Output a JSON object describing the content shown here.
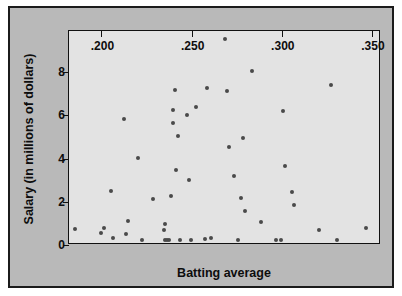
{
  "chart_data": {
    "type": "scatter",
    "title": "",
    "xlabel": "Batting average",
    "ylabel": "Salary (in millions of dollars)",
    "xlim": [
      0.182,
      0.355
    ],
    "ylim": [
      0,
      9.9
    ],
    "xticks": [
      0.2,
      0.25,
      0.3,
      0.35
    ],
    "xticklabels": [
      ".200",
      ".250",
      ".300",
      ".350"
    ],
    "yticks": [
      0,
      2,
      4,
      6,
      8
    ],
    "yticklabels": [
      "0",
      "2",
      "4",
      "6",
      "8"
    ],
    "grid": false,
    "legend": null,
    "marker_color": "#4a4a4a",
    "plot_bg_color": "#e3e3e3",
    "figure_bg_color": "#b9b9b9",
    "frame_color": "#111111",
    "n_points": 57,
    "points": [
      {
        "x": 0.1855,
        "y": 0.72
      },
      {
        "x": 0.1995,
        "y": 0.57
      },
      {
        "x": 0.2015,
        "y": 0.8
      },
      {
        "x": 0.2055,
        "y": 2.5
      },
      {
        "x": 0.2065,
        "y": 0.33
      },
      {
        "x": 0.2125,
        "y": 5.85
      },
      {
        "x": 0.2135,
        "y": 0.52
      },
      {
        "x": 0.2145,
        "y": 1.1
      },
      {
        "x": 0.2205,
        "y": 4.02
      },
      {
        "x": 0.2225,
        "y": 0.22
      },
      {
        "x": 0.2285,
        "y": 2.12
      },
      {
        "x": 0.2345,
        "y": 0.7
      },
      {
        "x": 0.2355,
        "y": 0.97
      },
      {
        "x": 0.2355,
        "y": 0.23
      },
      {
        "x": 0.2365,
        "y": 0.21
      },
      {
        "x": 0.2375,
        "y": 0.22
      },
      {
        "x": 0.2385,
        "y": 2.28
      },
      {
        "x": 0.2395,
        "y": 5.65
      },
      {
        "x": 0.2395,
        "y": 6.25
      },
      {
        "x": 0.2405,
        "y": 7.18
      },
      {
        "x": 0.2415,
        "y": 3.47
      },
      {
        "x": 0.2425,
        "y": 5.02
      },
      {
        "x": 0.2435,
        "y": 0.22
      },
      {
        "x": 0.2475,
        "y": 6.02
      },
      {
        "x": 0.2485,
        "y": 3.03
      },
      {
        "x": 0.2495,
        "y": 0.23
      },
      {
        "x": 0.2525,
        "y": 6.37
      },
      {
        "x": 0.2575,
        "y": 0.28
      },
      {
        "x": 0.2585,
        "y": 7.28
      },
      {
        "x": 0.2605,
        "y": 0.32
      },
      {
        "x": 0.2685,
        "y": 9.52
      },
      {
        "x": 0.2695,
        "y": 7.12
      },
      {
        "x": 0.2705,
        "y": 4.52
      },
      {
        "x": 0.2735,
        "y": 3.2
      },
      {
        "x": 0.2755,
        "y": 0.22
      },
      {
        "x": 0.2775,
        "y": 2.17
      },
      {
        "x": 0.2785,
        "y": 4.93
      },
      {
        "x": 0.2795,
        "y": 1.55
      },
      {
        "x": 0.2835,
        "y": 8.05
      },
      {
        "x": 0.2885,
        "y": 1.07
      },
      {
        "x": 0.2965,
        "y": 0.22
      },
      {
        "x": 0.2995,
        "y": 0.22
      },
      {
        "x": 0.3005,
        "y": 6.22
      },
      {
        "x": 0.3015,
        "y": 3.67
      },
      {
        "x": 0.3055,
        "y": 2.45
      },
      {
        "x": 0.3065,
        "y": 1.85
      },
      {
        "x": 0.3205,
        "y": 0.68
      },
      {
        "x": 0.3275,
        "y": 7.38
      },
      {
        "x": 0.3305,
        "y": 0.22
      },
      {
        "x": 0.3465,
        "y": 0.8
      }
    ]
  }
}
